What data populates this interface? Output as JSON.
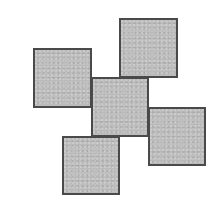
{
  "figure": {
    "background": "#ffffff",
    "fill_color": "#b9b9b9",
    "stroke_color": "#4a4a4a",
    "squares": [
      {
        "id": "top-left",
        "left": 33,
        "top": 48,
        "width": 59,
        "height": 60,
        "z": 1
      },
      {
        "id": "center",
        "left": 91,
        "top": 77,
        "width": 58,
        "height": 60,
        "z": 2
      },
      {
        "id": "top-right",
        "left": 119,
        "top": 18,
        "width": 59,
        "height": 60,
        "z": 3
      },
      {
        "id": "right",
        "left": 148,
        "top": 107,
        "width": 58,
        "height": 59,
        "z": 3
      },
      {
        "id": "bottom",
        "left": 62,
        "top": 136,
        "width": 58,
        "height": 59,
        "z": 3
      }
    ]
  }
}
